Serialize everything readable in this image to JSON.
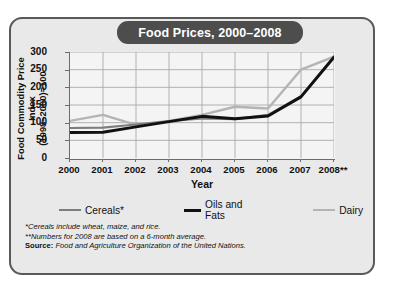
{
  "title": "Food Prices, 2000–2008",
  "axis": {
    "y_title_line1": "Food Commodity Price Index",
    "y_title_line2": "(1998–2000)=100",
    "x_title": "Year"
  },
  "legend": [
    {
      "name": "Cereals*",
      "color": "#7d7d7d"
    },
    {
      "name": "Oils and Fats",
      "color": "#111111"
    },
    {
      "name": "Dairy",
      "color": "#b4b4b4"
    }
  ],
  "notes": [
    "*Cereals include wheat, maize, and rice.",
    "**Numbers for 2008 are based on a 6-month average."
  ],
  "source_label": "Source:",
  "source_text": " Food and Agriculture Organization of the United Nations.",
  "colors": {
    "card_bg": "#e9e9e9",
    "card_border": "#595959",
    "title_pill": "#4d4d4d",
    "plot_bg": "#f4f4f4",
    "grid": "#a9a9a9",
    "axis": "#6b6b6b"
  },
  "chart_data": {
    "type": "line",
    "title": "Food Prices, 2000–2008",
    "xlabel": "Year",
    "ylabel": "Food Commodity Price Index (1998–2000)=100",
    "categories": [
      "2000",
      "2001",
      "2002",
      "2003",
      "2004",
      "2005",
      "2006",
      "2007",
      "2008**"
    ],
    "ylim": [
      0,
      300
    ],
    "yticks": [
      0,
      50,
      100,
      150,
      200,
      250,
      300
    ],
    "grid": true,
    "legend_position": "bottom",
    "series": [
      {
        "name": "Cereals*",
        "color": "#7d7d7d",
        "width": 2.1,
        "values": [
          85,
          86,
          95,
          104,
          112,
          110,
          122,
          175,
          288
        ]
      },
      {
        "name": "Oils and Fats",
        "color": "#111111",
        "width": 2.9,
        "values": [
          72,
          73,
          88,
          103,
          118,
          111,
          119,
          173,
          285
        ]
      },
      {
        "name": "Dairy",
        "color": "#b4b4b4",
        "width": 2.4,
        "values": [
          105,
          122,
          94,
          105,
          122,
          145,
          140,
          250,
          287
        ]
      }
    ]
  }
}
